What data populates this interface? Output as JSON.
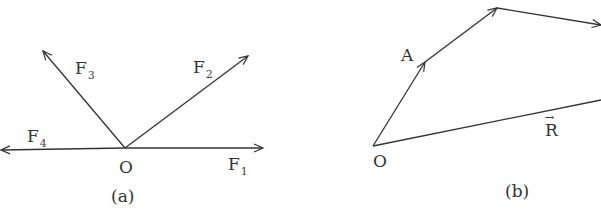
{
  "figure_a": {
    "caption": "(a)",
    "origin_label": "O",
    "forces": [
      {
        "name": "F",
        "sub": "1"
      },
      {
        "name": "F",
        "sub": "2"
      },
      {
        "name": "F",
        "sub": "3"
      },
      {
        "name": "F",
        "sub": "4"
      }
    ]
  },
  "figure_b": {
    "caption": "(b)",
    "origin_label": "O",
    "point_label": "A",
    "resultant_label": "R",
    "resultant_arrow": "→"
  },
  "colors": {
    "line": "#333333",
    "text": "#333333"
  }
}
